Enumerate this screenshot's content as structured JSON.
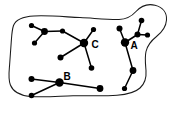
{
  "figure": {
    "background_color": "#ffffff",
    "ink_color": "#000000",
    "outline_color": "#1a1a1a",
    "width": 176,
    "height": 113
  },
  "region": {
    "name": "study-area-outline",
    "stroke_width": 1.05,
    "path": "M 13.5 25.5 C 16 19 24 16.5 34 16 C 48 15.2 64 16.8 80 17.6 C 96 18.4 108 19.6 119 19.4 C 127 19.2 132 16 136 11.5 C 141 6 148 3.5 155 5.2 C 163 7.2 167 13 166.5 20 C 166 27.5 161.5 32.5 156.5 36.5 C 151.5 40.5 147.5 45 146 51.5 C 144.6 57.5 145.5 64 146 70.5 C 146.5 77 145 83.5 140 88 C 134.5 93 126 94.6 117 95.2 C 103 96.2 88 95.4 73 95.8 C 58 96.2 43 97.6 30 96.4 C 20 95.4 13 91.5 10.4 85 C 8 79 9 72 9.6 65 C 10.2 57.5 10.6 50 11.2 42.5 C 11.7 36.5 11.8 30.5 13.5 25.5 Z"
  },
  "labels": [
    {
      "id": "label-a",
      "text": "A",
      "x": 134,
      "y": 46
    },
    {
      "id": "label-b",
      "text": "B",
      "x": 67,
      "y": 77
    },
    {
      "id": "label-c",
      "text": "C",
      "x": 95,
      "y": 45
    }
  ],
  "clusters": [
    {
      "id": "cluster-c",
      "label": "C",
      "nodes": [
        {
          "id": "c1",
          "x": 31.5,
          "y": 25.5,
          "r": 2.6
        },
        {
          "id": "c2",
          "x": 44.5,
          "y": 31.5,
          "r": 3.4
        },
        {
          "id": "c3",
          "x": 34.5,
          "y": 43.0,
          "r": 2.6
        },
        {
          "id": "c4",
          "x": 62.5,
          "y": 31.0,
          "r": 2.6
        },
        {
          "id": "c5",
          "x": 84.0,
          "y": 43.0,
          "r": 4.2
        },
        {
          "id": "c6",
          "x": 93.5,
          "y": 29.5,
          "r": 2.6
        },
        {
          "id": "c7",
          "x": 60.5,
          "y": 57.5,
          "r": 3.0
        },
        {
          "id": "c8",
          "x": 91.5,
          "y": 68.0,
          "r": 2.8
        }
      ],
      "edges": [
        {
          "from": "c1",
          "to": "c2"
        },
        {
          "from": "c2",
          "to": "c3"
        },
        {
          "from": "c2",
          "to": "c4"
        },
        {
          "from": "c4",
          "to": "c5"
        },
        {
          "from": "c5",
          "to": "c6"
        },
        {
          "from": "c5",
          "to": "c7"
        },
        {
          "from": "c5",
          "to": "c8"
        }
      ]
    },
    {
      "id": "cluster-b",
      "label": "B",
      "nodes": [
        {
          "id": "b1",
          "x": 31.5,
          "y": 79.0,
          "r": 3.0
        },
        {
          "id": "b2",
          "x": 59.5,
          "y": 82.5,
          "r": 4.2
        },
        {
          "id": "b3",
          "x": 31.5,
          "y": 95.5,
          "r": 2.8
        },
        {
          "id": "b4",
          "x": 100.0,
          "y": 88.5,
          "r": 3.4
        }
      ],
      "edges": [
        {
          "from": "b1",
          "to": "b2"
        },
        {
          "from": "b2",
          "to": "b3"
        },
        {
          "from": "b2",
          "to": "b4"
        }
      ]
    },
    {
      "id": "cluster-a",
      "label": "A",
      "nodes": [
        {
          "id": "a1",
          "x": 119.5,
          "y": 28.5,
          "r": 3.0
        },
        {
          "id": "a2",
          "x": 125.0,
          "y": 42.5,
          "r": 4.2
        },
        {
          "id": "a3",
          "x": 137.5,
          "y": 34.5,
          "r": 3.0
        },
        {
          "id": "a4",
          "x": 141.5,
          "y": 20.5,
          "r": 2.8
        },
        {
          "id": "a5",
          "x": 147.5,
          "y": 35.0,
          "r": 2.6
        },
        {
          "id": "a6",
          "x": 133.0,
          "y": 70.5,
          "r": 3.4
        },
        {
          "id": "a7",
          "x": 124.5,
          "y": 88.5,
          "r": 2.6
        }
      ],
      "edges": [
        {
          "from": "a1",
          "to": "a2"
        },
        {
          "from": "a2",
          "to": "a3"
        },
        {
          "from": "a3",
          "to": "a4"
        },
        {
          "from": "a3",
          "to": "a5"
        },
        {
          "from": "a2",
          "to": "a6"
        },
        {
          "from": "a6",
          "to": "a7"
        }
      ]
    }
  ]
}
